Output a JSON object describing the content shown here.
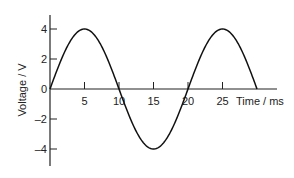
{
  "chart_data": {
    "type": "line",
    "title": "",
    "xlabel": "Time / ms",
    "ylabel": "Voltage / V",
    "xlim": [
      0,
      33
    ],
    "ylim": [
      -5,
      5
    ],
    "grid": false,
    "legend": null,
    "x_ticks": [
      5,
      10,
      15,
      20,
      25
    ],
    "x_tick_labels": [
      "5",
      "10",
      "15",
      "20",
      "25"
    ],
    "y_ticks": [
      4,
      2,
      0,
      -2,
      -4
    ],
    "y_tick_labels": [
      "4",
      "2",
      "0",
      "–2",
      "–4"
    ],
    "series": [
      {
        "name": "Voltage",
        "description": "sine wave, amplitude 4 V, period 20 ms",
        "amplitude": 4,
        "period_ms": 20,
        "x": [
          0,
          2.5,
          5,
          7.5,
          10,
          12.5,
          15,
          17.5,
          20,
          22.5,
          25,
          27.5,
          30
        ],
        "values": [
          0,
          2.83,
          4,
          2.83,
          0,
          -2.83,
          -4,
          -2.83,
          0,
          2.83,
          4,
          2.83,
          0
        ]
      }
    ],
    "color": "#111111"
  }
}
